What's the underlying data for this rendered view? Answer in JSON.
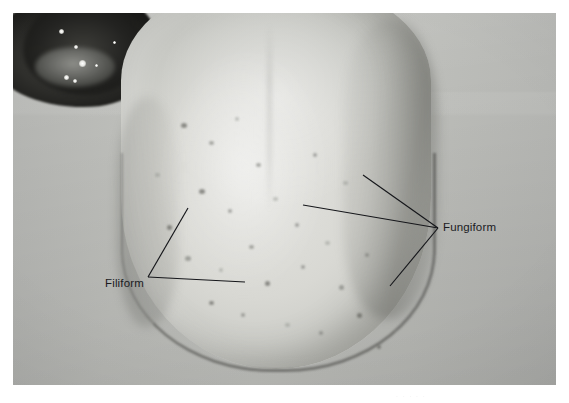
{
  "image": {
    "kind": "clinical-photograph",
    "subject": "human tongue dorsum",
    "plate": {
      "left": 13,
      "top": 13,
      "width": 543,
      "height": 372,
      "background_color": "#bdbeba",
      "border_color": "#ffffff"
    }
  },
  "annotations": {
    "fungiform": {
      "label": "Fungiform",
      "vertex": {
        "x": 438,
        "y": 228
      },
      "leaders": [
        {
          "x1": 438,
          "y1": 228,
          "x2": 363,
          "y2": 175
        },
        {
          "x1": 438,
          "y1": 228,
          "x2": 303,
          "y2": 205
        },
        {
          "x1": 438,
          "y1": 228,
          "x2": 390,
          "y2": 286
        }
      ]
    },
    "filiform": {
      "label": "Filiform",
      "vertex": {
        "x": 148,
        "y": 277
      },
      "leaders": [
        {
          "x1": 148,
          "y1": 277,
          "x2": 188,
          "y2": 208
        },
        {
          "x1": 148,
          "y1": 277,
          "x2": 245,
          "y2": 282
        }
      ]
    },
    "line_color": "#15161a",
    "text_color": "#1a1b1f"
  },
  "caption": {
    "text": ". . . . ."
  },
  "anatomy": {
    "oral_cavity": {
      "label": "oral cavity",
      "tone": "#1f1f1d"
    },
    "tongue_body": {
      "label": "tongue dorsum",
      "tone": "#d9d9d4"
    },
    "papillae_count_visible": 26
  }
}
